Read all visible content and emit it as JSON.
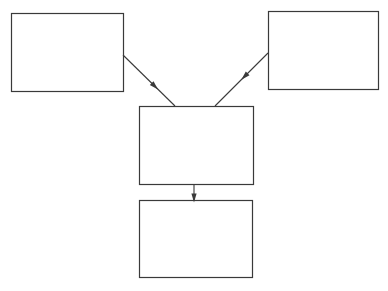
{
  "diagram": {
    "stroke_color": "#3a3a3a",
    "background": "#ffffff",
    "nodes": [
      {
        "id": "box-top-left",
        "x": 11,
        "y": 13,
        "w": 112,
        "h": 78,
        "label": ""
      },
      {
        "id": "box-top-right",
        "x": 268,
        "y": 11,
        "w": 110,
        "h": 78,
        "label": ""
      },
      {
        "id": "box-middle",
        "x": 139,
        "y": 106,
        "w": 114,
        "h": 78,
        "label": ""
      },
      {
        "id": "box-bottom",
        "x": 139,
        "y": 200,
        "w": 113,
        "h": 77,
        "label": ""
      }
    ],
    "edges": [
      {
        "from": "box-top-left",
        "to": "box-middle",
        "x1": 123,
        "y1": 55,
        "x2": 175,
        "y2": 106,
        "arrow_at": 0.62
      },
      {
        "from": "box-top-right",
        "to": "box-middle",
        "x1": 268,
        "y1": 53,
        "x2": 215,
        "y2": 106,
        "arrow_at": 0.45
      },
      {
        "from": "box-middle",
        "to": "box-bottom",
        "x1": 194,
        "y1": 184,
        "x2": 194,
        "y2": 200,
        "arrow_at": 0.9
      }
    ]
  }
}
